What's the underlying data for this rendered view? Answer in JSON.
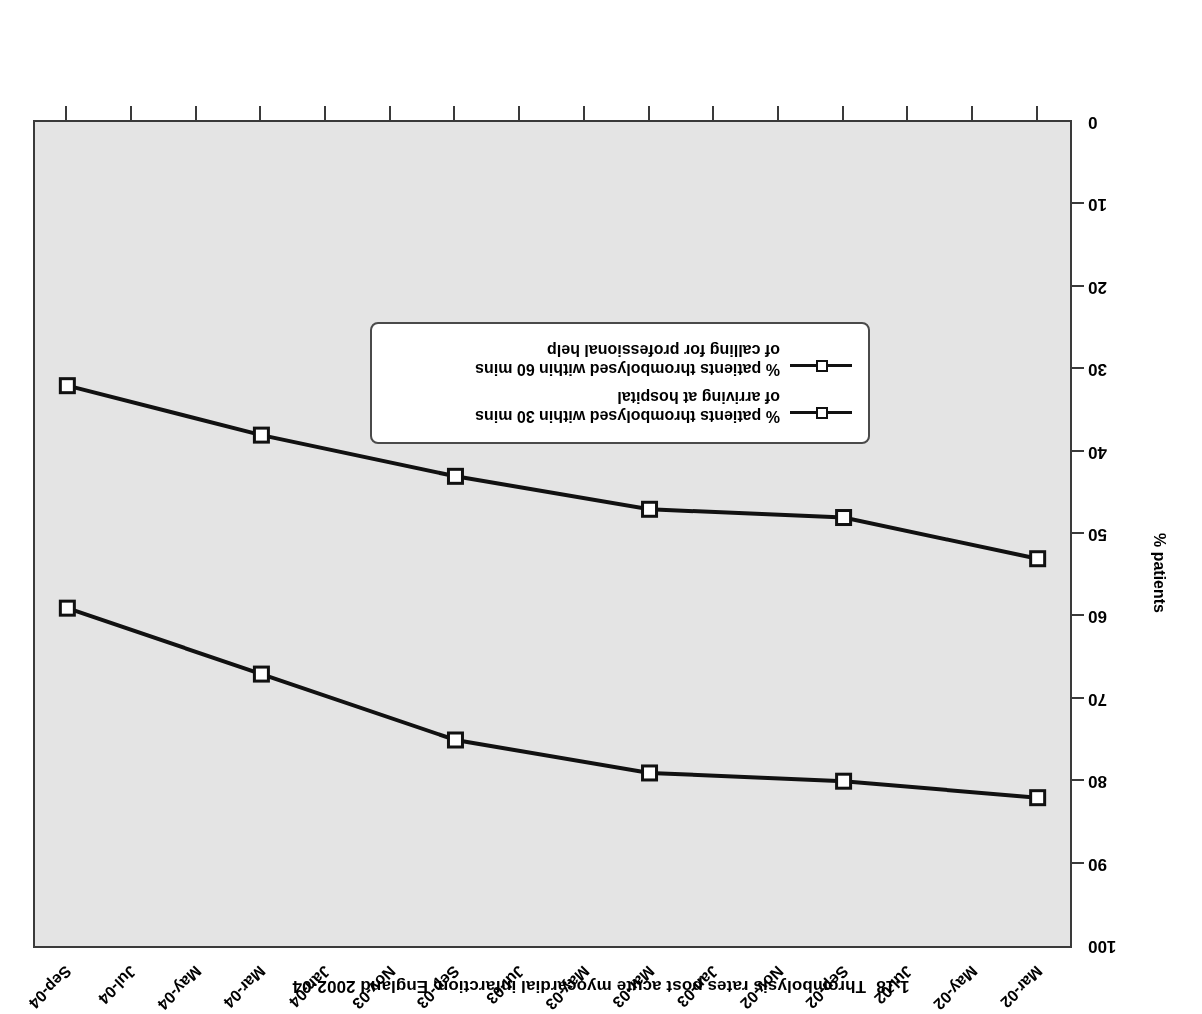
{
  "figure": {
    "number": "1.18",
    "title": "Thrombolysis rates post acute myocardial infarction, England 2002-04",
    "orientation": "rotated-180",
    "plot_background": "#e4e4e4",
    "frame_color": "#3a3a3a",
    "series_color": "#111111",
    "marker_fill": "#ffffff"
  },
  "axes": {
    "y_title": "% patients",
    "y_ticks": [
      0,
      10,
      20,
      30,
      40,
      50,
      60,
      70,
      80,
      90,
      100
    ],
    "x_ticks": [
      "Mar-02",
      "May-02",
      "Jul-02",
      "Sep-02",
      "Nov-02",
      "Jan-03",
      "Mar-03",
      "May-03",
      "Jul-03",
      "Sep-03",
      "Nov-03",
      "Jan-04",
      "Mar-04",
      "May-04",
      "Jul-04",
      "Sep-04"
    ]
  },
  "legend": {
    "entries": [
      {
        "line1": "% patients thrombolysed within 30 mins",
        "line2": "of arriving at hospital"
      },
      {
        "line1": "% patients thrombolysed within 60 mins",
        "line2": "of calling for professional help"
      }
    ]
  },
  "chart_data": {
    "type": "line",
    "xlabel": "",
    "ylabel": "% patients",
    "ylim": [
      0,
      100
    ],
    "grid": false,
    "legend_position": "inside-upper-left",
    "x": [
      "Mar-02",
      "Sep-02",
      "Mar-03",
      "Sep-03",
      "Mar-04",
      "Sep-04"
    ],
    "x_tick_labels": [
      "Mar-02",
      "May-02",
      "Jul-02",
      "Sep-02",
      "Nov-02",
      "Jan-03",
      "Mar-03",
      "May-03",
      "Jul-03",
      "Sep-03",
      "Nov-03",
      "Jan-04",
      "Mar-04",
      "May-04",
      "Jul-04",
      "Sep-04"
    ],
    "series": [
      {
        "name": "% patients thrombolysed within 30 mins of arriving at hospital",
        "values": [
          53,
          48,
          47,
          43,
          38,
          32
        ]
      },
      {
        "name": "% patients thrombolysed within 60 mins of calling for professional help",
        "values": [
          82,
          80,
          79,
          75,
          67,
          59
        ]
      }
    ]
  }
}
